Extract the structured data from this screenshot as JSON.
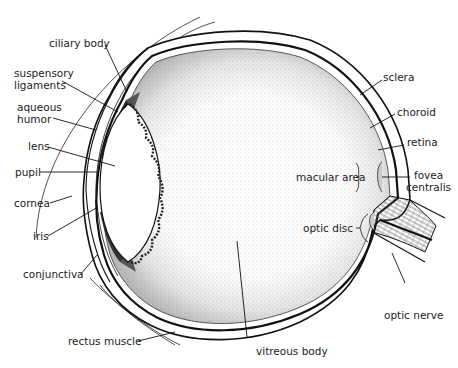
{
  "labels": {
    "ciliary_body": "ciliary body",
    "suspensory_ligaments_1": "suspensory",
    "suspensory_ligaments_2": "ligaments",
    "aqueous_humor_1": "aqueous",
    "aqueous_humor_2": "humor",
    "lens": "lens",
    "pupil": "pupil",
    "cornea": "cornea",
    "iris": "iris",
    "conjunctiva": "conjunctiva",
    "rectus_muscle": "rectus muscle",
    "vitreous_body": "vitreous body",
    "sclera": "sclera",
    "choroid": "choroid",
    "retina": "retina",
    "macular_area": "macular area",
    "fovea_centralis_1": "fovea",
    "fovea_centralis_2": "centralis",
    "optic_disc": "optic disc",
    "optic_nerve": "optic nerve"
  },
  "colors": {
    "ink": "#1a1a1a",
    "paper": "#ffffff",
    "stipple": "#555555"
  }
}
